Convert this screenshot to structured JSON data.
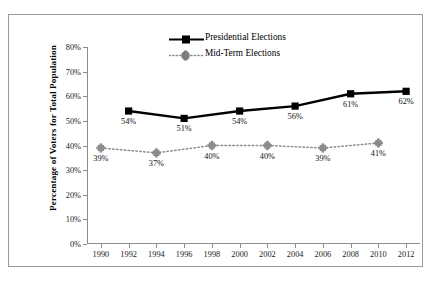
{
  "chart_data": {
    "type": "line",
    "title": "",
    "xlabel": "",
    "ylabel": "Percentage of Voters for Total Population",
    "x": [
      1990,
      1992,
      1994,
      1996,
      1998,
      2000,
      2002,
      2004,
      2006,
      2008,
      2010,
      2012
    ],
    "xtick_labels": [
      "1990",
      "1992",
      "1994",
      "1996",
      "1998",
      "2000",
      "2002",
      "2004",
      "2006",
      "2008",
      "2010",
      "2012"
    ],
    "xlim": [
      1989,
      2013
    ],
    "ylim": [
      0,
      80
    ],
    "ytick_labels": [
      "0%",
      "10%",
      "20%",
      "30%",
      "40%",
      "50%",
      "60%",
      "70%",
      "80%"
    ],
    "ytick_values": [
      0,
      10,
      20,
      30,
      40,
      50,
      60,
      70,
      80
    ],
    "grid": false,
    "legend_position": "top-center",
    "series": [
      {
        "name": "Presidential Elections",
        "color": "#000000",
        "line_style": "solid",
        "marker": "square",
        "points": [
          {
            "x": 1992,
            "y": 54,
            "label": "54%"
          },
          {
            "x": 1996,
            "y": 51,
            "label": "51%"
          },
          {
            "x": 2000,
            "y": 54,
            "label": "54%"
          },
          {
            "x": 2004,
            "y": 56,
            "label": "56%"
          },
          {
            "x": 2008,
            "y": 61,
            "label": "61%"
          },
          {
            "x": 2012,
            "y": 62,
            "label": "62%"
          }
        ]
      },
      {
        "name": "Mid-Term Elections",
        "color": "#8c8c8c",
        "line_style": "dotted",
        "marker": "cross",
        "points": [
          {
            "x": 1990,
            "y": 39,
            "label": "39%"
          },
          {
            "x": 1994,
            "y": 37,
            "label": "37%"
          },
          {
            "x": 1998,
            "y": 40,
            "label": "40%"
          },
          {
            "x": 2002,
            "y": 40,
            "label": "40%"
          },
          {
            "x": 2006,
            "y": 39,
            "label": "39%"
          },
          {
            "x": 2010,
            "y": 41,
            "label": "41%"
          }
        ]
      }
    ]
  },
  "legend": {
    "items": [
      {
        "label": "Presidential Elections"
      },
      {
        "label": "Mid-Term Elections"
      }
    ]
  }
}
